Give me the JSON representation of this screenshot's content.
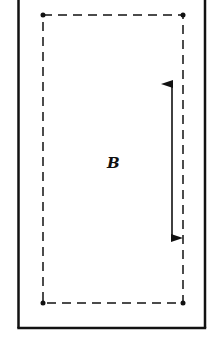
{
  "diagram": {
    "region_label": "B",
    "frame": {
      "style": "solid",
      "open_side": "top",
      "color": "#111111"
    },
    "boundary": {
      "style": "dashed",
      "corner_markers": "dots",
      "color": "#111111"
    },
    "arrow": {
      "type": "double-headed",
      "orientation": "vertical",
      "color": "#111111"
    }
  }
}
